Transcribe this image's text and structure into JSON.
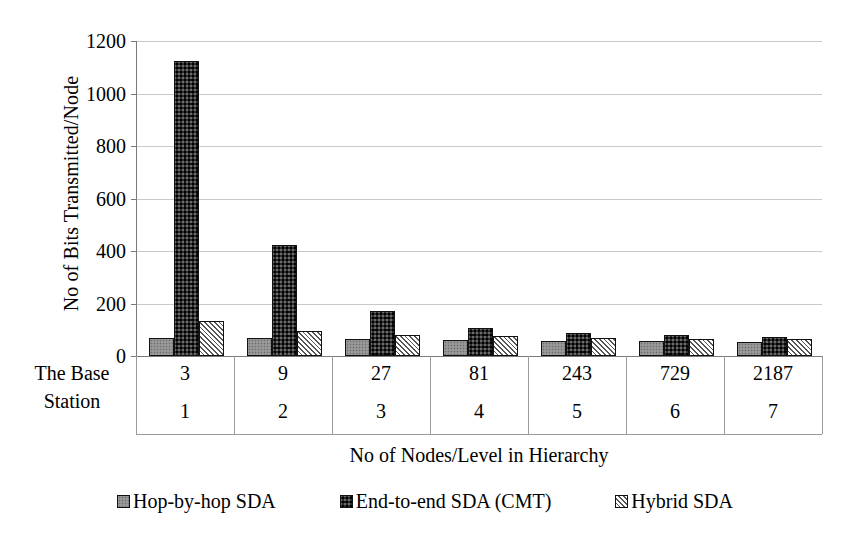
{
  "chart_data": {
    "type": "bar",
    "title": "",
    "xlabel": "No of Nodes/Level in Hierarchy",
    "ylabel": "No of Bits Transmitted/Node",
    "categories": [
      "3",
      "9",
      "27",
      "81",
      "243",
      "729",
      "2187"
    ],
    "secondary_categories": [
      "1",
      "2",
      "3",
      "4",
      "5",
      "6",
      "7"
    ],
    "corner_label": "The Base Station",
    "ylim": [
      0,
      1200
    ],
    "yticks": [
      0,
      200,
      400,
      600,
      800,
      1000,
      1200
    ],
    "grid": true,
    "legend_position": "bottom",
    "series": [
      {
        "name": "Hop-by-hop SDA",
        "color": "#8f8f8f",
        "pattern": "fine-dots",
        "values": [
          70,
          68,
          64,
          62,
          58,
          58,
          55
        ]
      },
      {
        "name": "End-to-end SDA (CMT)",
        "color": "#2e2e2e",
        "pattern": "coarse-speckle",
        "values": [
          1124,
          422,
          172,
          107,
          88,
          79,
          71
        ]
      },
      {
        "name": "Hybrid SDA",
        "color": "#ffffff",
        "pattern": "diagonal-hatch",
        "values": [
          135,
          95,
          80,
          76,
          68,
          66,
          63
        ]
      }
    ]
  },
  "axis": {
    "y_title": "No of Bits Transmitted/Node",
    "x_title": "No of Nodes/Level in Hierarchy",
    "y_tick_labels": [
      "1200",
      "1000",
      "800",
      "600",
      "400",
      "200",
      "0"
    ]
  },
  "legend": {
    "items": [
      {
        "label": "Hop-by-hop SDA"
      },
      {
        "label": "End-to-end SDA (CMT)"
      },
      {
        "label": "Hybrid SDA"
      }
    ]
  },
  "category_axis": {
    "corner_line1": "The Base",
    "corner_line2": "Station",
    "row1": [
      "3",
      "9",
      "27",
      "81",
      "243",
      "729",
      "2187"
    ],
    "row2": [
      "1",
      "2",
      "3",
      "4",
      "5",
      "6",
      "7"
    ]
  }
}
